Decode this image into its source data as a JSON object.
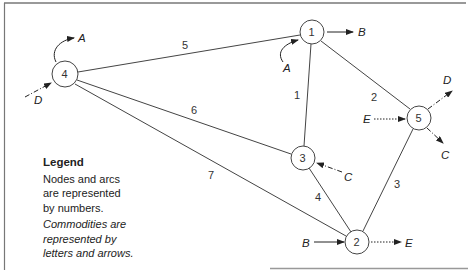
{
  "diagram": {
    "type": "network",
    "frame": {
      "border_color": "#777777"
    },
    "nodes": [
      {
        "id": "1",
        "label": "1",
        "x": 312,
        "y": 32
      },
      {
        "id": "2",
        "label": "2",
        "x": 357,
        "y": 242
      },
      {
        "id": "3",
        "label": "3",
        "x": 303,
        "y": 158
      },
      {
        "id": "4",
        "label": "4",
        "x": 65,
        "y": 74
      },
      {
        "id": "5",
        "label": "5",
        "x": 419,
        "y": 118
      }
    ],
    "arcs": [
      {
        "id": "1",
        "label": "1",
        "from": "1",
        "to": "3"
      },
      {
        "id": "2",
        "label": "2",
        "from": "1",
        "to": "5"
      },
      {
        "id": "3",
        "label": "3",
        "from": "5",
        "to": "2"
      },
      {
        "id": "4",
        "label": "4",
        "from": "3",
        "to": "2"
      },
      {
        "id": "5",
        "label": "5",
        "from": "4",
        "to": "1"
      },
      {
        "id": "6",
        "label": "6",
        "from": "4",
        "to": "3"
      },
      {
        "id": "7",
        "label": "7",
        "from": "4",
        "to": "2"
      }
    ],
    "commodities": [
      {
        "label": "A",
        "node": "4",
        "direction": "out",
        "style": "solid-curved"
      },
      {
        "label": "D",
        "node": "4",
        "direction": "in",
        "style": "dash-dot"
      },
      {
        "label": "B",
        "node": "1",
        "direction": "out",
        "style": "solid"
      },
      {
        "label": "A",
        "node": "1",
        "direction": "in",
        "style": "solid-curved"
      },
      {
        "label": "D",
        "node": "5",
        "direction": "out",
        "style": "dash-dot"
      },
      {
        "label": "E",
        "node": "5",
        "direction": "in",
        "style": "dotted"
      },
      {
        "label": "C",
        "node": "5",
        "direction": "out",
        "style": "dash-dot"
      },
      {
        "label": "C",
        "node": "3",
        "direction": "in",
        "style": "dash-dot"
      },
      {
        "label": "B",
        "node": "2",
        "direction": "in",
        "style": "solid"
      },
      {
        "label": "E",
        "node": "2",
        "direction": "out",
        "style": "dotted"
      }
    ]
  },
  "legend": {
    "title": "Legend",
    "line1": "Nodes and arcs",
    "line2": "are represented",
    "line3": "by numbers.",
    "line4": "Commodities are",
    "line5": "represented by",
    "line6": "letters and arrows."
  }
}
